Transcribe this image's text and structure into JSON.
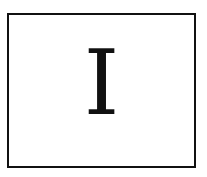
{
  "card": {
    "letter": "I",
    "border_color": "#111111",
    "text_color": "#111111",
    "background": "#ffffff"
  }
}
